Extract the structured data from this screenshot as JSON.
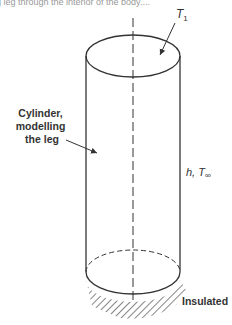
{
  "caption_fragment": "g leg through the interior of the body....",
  "labels": {
    "top_temperature": "T",
    "top_temperature_sub": "1",
    "cylinder": [
      "Cylinder,",
      "modelling",
      "the leg"
    ],
    "convection": "h, T",
    "convection_sub": "∞",
    "base": "Insulated"
  },
  "colors": {
    "line": "#333333",
    "text": "#333333"
  }
}
